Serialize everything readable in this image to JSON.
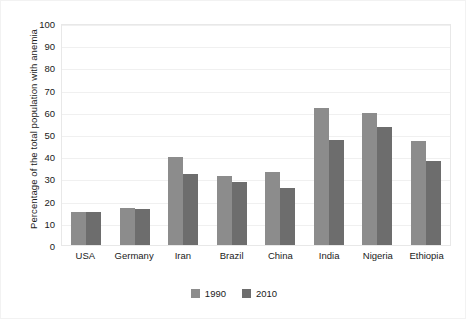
{
  "chart_data": {
    "type": "bar",
    "title": "",
    "xlabel": "",
    "ylabel": "Percentage of the total population with anemia",
    "ylim": [
      0,
      100
    ],
    "ytick_step": 10,
    "yticks": [
      100,
      90,
      80,
      70,
      60,
      50,
      40,
      30,
      20,
      10,
      0
    ],
    "grid": true,
    "legend_position": "bottom-center",
    "categories": [
      "USA",
      "Germany",
      "Iran",
      "Brazil",
      "China",
      "India",
      "Nigeria",
      "Ethiopia"
    ],
    "series": [
      {
        "name": "1990",
        "color": "#8c8c8c",
        "values": [
          15,
          16.5,
          39.5,
          31,
          33,
          61.5,
          59.5,
          47
        ]
      },
      {
        "name": "2010",
        "color": "#6d6d6d",
        "values": [
          15,
          16,
          32,
          28.5,
          25.5,
          47.5,
          53,
          38
        ]
      }
    ]
  },
  "legend": {
    "items": [
      {
        "label": "1990"
      },
      {
        "label": "2010"
      }
    ]
  },
  "colors": {
    "series_1990": "#8c8c8c",
    "series_2010": "#6d6d6d",
    "grid": "#f0f0f0",
    "axis_border": "#e8e8e8",
    "text": "#1a1a1a",
    "background": "#ffffff"
  }
}
